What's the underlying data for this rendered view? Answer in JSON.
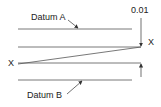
{
  "diagram": {
    "labels": {
      "datum_a": "Datum A",
      "datum_b": "Datum B",
      "tolerance": "0.01",
      "x_left": "X",
      "x_right": "X"
    },
    "colors": {
      "line": "#333333",
      "text": "#222222"
    }
  }
}
